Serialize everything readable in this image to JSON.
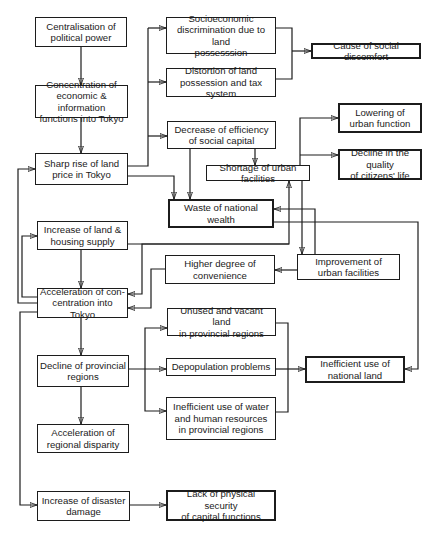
{
  "diagram": {
    "type": "flowchart",
    "nodes": {
      "centralisation": {
        "label": "Centralisation of\npolitical power",
        "emphasis": false
      },
      "concentration": {
        "label": "Concentration of\neconomic & information\nfunctions into Tokyo",
        "emphasis": false
      },
      "sharp_rise": {
        "label": "Sharp rise of land\nprice in Tokyo",
        "emphasis": false
      },
      "increase_supply": {
        "label": "Increase of land &\nhousing supply",
        "emphasis": false
      },
      "acceleration_concentration": {
        "label": "Acceleration of con-\ncentration into Tokyo",
        "emphasis": false
      },
      "decline_provincial": {
        "label": "Decline of provincial\nregions",
        "emphasis": false
      },
      "regional_disparity": {
        "label": "Acceleration of\nregional disparity",
        "emphasis": false
      },
      "disaster_damage": {
        "label": "Increase of disaster\ndamage",
        "emphasis": false
      },
      "socioeconomic_discrimination": {
        "label": "Socioeconomic\ndiscrimination due to land\npossesssion",
        "emphasis": false
      },
      "distortion": {
        "label": "Distortion of land\npossession and tax system",
        "emphasis": false
      },
      "social_discomfort": {
        "label": "Cause of social discomfort",
        "emphasis": true
      },
      "decrease_efficiency": {
        "label": "Decrease of efficiency\nof social capital",
        "emphasis": false
      },
      "shortage_facilities": {
        "label": "Shortage of urban facilities",
        "emphasis": false
      },
      "lowering_function": {
        "label": "Lowering of\nurban function",
        "emphasis": true
      },
      "decline_quality": {
        "label": "Decline in the quality\nof citizens' life",
        "emphasis": true
      },
      "waste_wealth": {
        "label": "Waste of national\nwealth",
        "emphasis": true
      },
      "higher_convenience": {
        "label": "Higher degree of\nconvenience",
        "emphasis": false
      },
      "improvement_facilities": {
        "label": "Improvement of\nurban facilities",
        "emphasis": false
      },
      "unused_land": {
        "label": "Unused and vacant land\nin provincial regions",
        "emphasis": false
      },
      "depopulation": {
        "label": "Depopulation problems",
        "emphasis": false
      },
      "inefficient_water": {
        "label": "Inefficient use of water\nand human resources\nin provincial regions",
        "emphasis": false
      },
      "inefficient_land": {
        "label": "Inefficient use of\nnational land",
        "emphasis": true
      },
      "physical_security": {
        "label": "Lack of physical security\nof capital functions",
        "emphasis": true
      }
    },
    "edges": [
      {
        "from": "centralisation",
        "to": "concentration"
      },
      {
        "from": "concentration",
        "to": "sharp_rise"
      },
      {
        "from": "sharp_rise",
        "to": "socioeconomic_discrimination"
      },
      {
        "from": "sharp_rise",
        "to": "distortion"
      },
      {
        "from": "sharp_rise",
        "to": "decrease_efficiency"
      },
      {
        "from": "sharp_rise",
        "to": "waste_wealth"
      },
      {
        "from": "sharp_rise",
        "to": "increase_supply"
      },
      {
        "from": "socioeconomic_discrimination",
        "to": "social_discomfort"
      },
      {
        "from": "distortion",
        "to": "social_discomfort"
      },
      {
        "from": "decrease_efficiency",
        "to": "shortage_facilities"
      },
      {
        "from": "decrease_efficiency",
        "to": "waste_wealth"
      },
      {
        "from": "shortage_facilities",
        "to": "lowering_function"
      },
      {
        "from": "shortage_facilities",
        "to": "decline_quality"
      },
      {
        "from": "shortage_facilities",
        "to": "improvement_facilities"
      },
      {
        "from": "improvement_facilities",
        "to": "shortage_facilities"
      },
      {
        "from": "improvement_facilities",
        "to": "waste_wealth"
      },
      {
        "from": "improvement_facilities",
        "to": "higher_convenience"
      },
      {
        "from": "higher_convenience",
        "to": "acceleration_concentration"
      },
      {
        "from": "waste_wealth",
        "to": "inefficient_land"
      },
      {
        "from": "shortage_facilities",
        "to": "acceleration_concentration"
      },
      {
        "from": "increase_supply",
        "to": "acceleration_concentration"
      },
      {
        "from": "acceleration_concentration",
        "to": "increase_supply"
      },
      {
        "from": "acceleration_concentration",
        "to": "sharp_rise"
      },
      {
        "from": "acceleration_concentration",
        "to": "decline_provincial"
      },
      {
        "from": "acceleration_concentration",
        "to": "disaster_damage"
      },
      {
        "from": "decline_provincial",
        "to": "unused_land"
      },
      {
        "from": "decline_provincial",
        "to": "depopulation"
      },
      {
        "from": "decline_provincial",
        "to": "inefficient_water"
      },
      {
        "from": "decline_provincial",
        "to": "regional_disparity"
      },
      {
        "from": "unused_land",
        "to": "inefficient_land"
      },
      {
        "from": "depopulation",
        "to": "inefficient_land"
      },
      {
        "from": "inefficient_water",
        "to": "inefficient_land"
      },
      {
        "from": "disaster_damage",
        "to": "physical_security"
      }
    ]
  }
}
